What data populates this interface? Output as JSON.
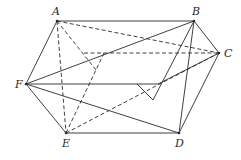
{
  "figure": {
    "type": "geometry-diagram",
    "stroke_color": "#2a2a2a",
    "vertices": [
      {
        "id": "A",
        "label": "A",
        "x": 57,
        "y": 21,
        "lx": 52,
        "ly": 15
      },
      {
        "id": "B",
        "label": "B",
        "x": 194,
        "y": 21,
        "lx": 192,
        "ly": 15
      },
      {
        "id": "C",
        "label": "C",
        "x": 219,
        "y": 53,
        "lx": 224,
        "ly": 57
      },
      {
        "id": "D",
        "label": "D",
        "x": 179,
        "y": 133,
        "lx": 175,
        "ly": 147
      },
      {
        "id": "E",
        "label": "E",
        "x": 66,
        "y": 133,
        "lx": 62,
        "ly": 147
      },
      {
        "id": "F",
        "label": "F",
        "x": 26,
        "y": 84,
        "lx": 15,
        "ly": 88
      }
    ],
    "aux_points": [
      {
        "id": "P",
        "x": 104,
        "y": 53
      },
      {
        "id": "Q",
        "x": 96,
        "y": 70
      },
      {
        "id": "R",
        "x": 158,
        "y": 84
      },
      {
        "id": "S",
        "x": 153,
        "y": 100
      },
      {
        "id": "H1",
        "x": 84,
        "y": 53
      },
      {
        "id": "H2",
        "x": 137,
        "y": 84
      }
    ],
    "segments": [
      {
        "from": "A",
        "to": "B",
        "style": "solid"
      },
      {
        "from": "B",
        "to": "C",
        "style": "solid"
      },
      {
        "from": "C",
        "to": "D",
        "style": "solid"
      },
      {
        "from": "D",
        "to": "E",
        "style": "solid"
      },
      {
        "from": "E",
        "to": "F",
        "style": "solid"
      },
      {
        "from": "F",
        "to": "A",
        "style": "solid"
      },
      {
        "from": "F",
        "to": "B",
        "style": "solid"
      },
      {
        "from": "F",
        "to": "D",
        "style": "solid"
      },
      {
        "from": "F",
        "to": "R",
        "style": "solid"
      },
      {
        "from": "R",
        "to": "C",
        "style": "solid"
      },
      {
        "from": "B",
        "to": "S",
        "style": "solid"
      },
      {
        "from": "B",
        "to": "D",
        "style": "solid"
      },
      {
        "from": "H2",
        "to": "S",
        "style": "solid"
      },
      {
        "from": "A",
        "to": "C",
        "style": "dashed"
      },
      {
        "from": "A",
        "to": "E",
        "style": "dashed"
      },
      {
        "from": "A",
        "to": "Q",
        "style": "dashed"
      },
      {
        "from": "H1",
        "to": "C",
        "style": "dashed"
      },
      {
        "from": "P",
        "to": "E",
        "style": "dashed"
      },
      {
        "from": "E",
        "to": "C",
        "style": "dashed"
      }
    ]
  }
}
